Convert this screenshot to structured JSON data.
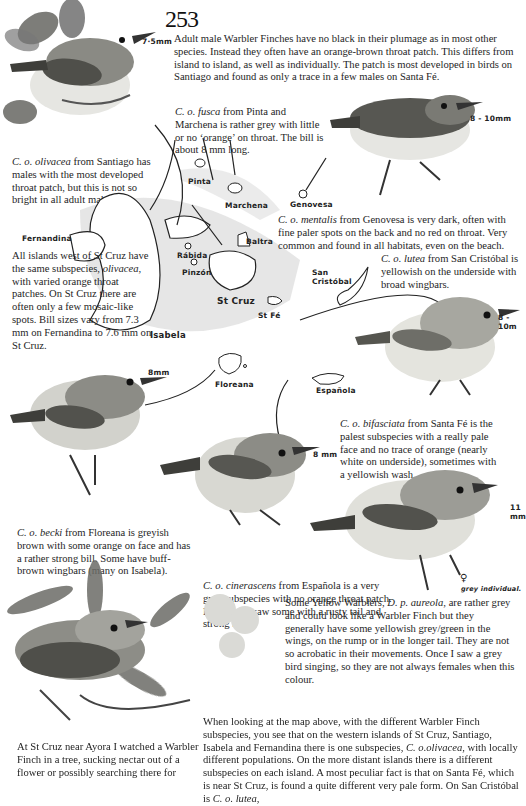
{
  "page": {
    "number": "253"
  },
  "intro": {
    "text": "Adult male Warbler Finches have no black in their plumage as in most other species. Instead they often have an orange-brown throat patch. This differs from island to island, as well as individually. The patch is most developed in birds on Santiago and found as only a trace in a few males on Santa Fé."
  },
  "captions": {
    "fusca": {
      "taxon": "C. o. fusca",
      "text": " from Pinta and Marchena is rather grey with little or no ‘orange’ on throat. The bill is about 8 mm long."
    },
    "olivacea": {
      "taxon": "C. o. olivacea",
      "text": " from Santiago has males with the most developed throat patch, but this is not so bright in all adult males."
    },
    "mentalis": {
      "taxon": "C. o. mentalis",
      "text": " from Genovesa is very dark, often with fine paler spots on the back and no red on throat. Very common and found in all habitats, even on the beach."
    },
    "lutea": {
      "taxon": "C. o. lutea",
      "text": " from San Cristóbal is yellowish on the underside with broad wingbars."
    },
    "west_islands": {
      "text_a": "All islands west of St Cruz have the same subspecies, ",
      "taxon": "olivacea",
      "text_b": ", with varied orange throat patches. On St Cruz there are often only a few mosaic-like spots. Bill sizes vary from 7.3 mm on Fernandina to 7.6 mm on St Cruz."
    },
    "bifasciata": {
      "taxon": "C. o. bifasciata",
      "text": " from Santa Fé is the palest subspecies with a really pale face and no trace of orange (nearly white on underside), sometimes with a yellowish wash."
    },
    "becki": {
      "taxon": "C. o. becki",
      "text": " from Floreana is greyish brown with some orange on face and has a rather strong bill. Some have buff-brown wingbars (many on Isabela)."
    },
    "cinerascens": {
      "taxon": "C. o. cinerascens",
      "text": " from Española is a very grey subspecies with no orange throat patch. However, I saw some with a rusty tail and strong bill."
    },
    "yellow_warbler": {
      "text_a": "Some Yellow Warblers, ",
      "taxon": "D. p. aureola",
      "text_b": ", are rather grey and could look like a Warbler Finch but they generally have some yellowish grey/green in the wings, on the rump or in the longer tail. They are not so acrobatic in their movements. Once I saw a grey bird singing, so they are not always females when this colour."
    },
    "ayora": {
      "text": "At St Cruz near Ayora I watched a Warbler Finch in a tree, sucking nectar out of a flower or possibly searching there for"
    },
    "map_summary": {
      "text_a": "When looking at the map above, with the different Warbler Finch subspecies, you see that on the western islands of St Cruz, Santiago, Isabela and Fernandina there is one subspecies, ",
      "taxon": "C. o.olivacea",
      "text_b": ", with locally different populations. On the more distant islands there is a different subspecies on each island. A most peculiar fact is that on Santa Fé, which is near St Cruz, is found a quite different very pale form. On San Cristóbal is ",
      "taxon2": "C. o. lutea",
      "text_c": ","
    }
  },
  "map_labels": {
    "pinta": "Pinta",
    "marchena": "Marchena",
    "genovesa": "Genovesa",
    "fernandina": "Fernandina",
    "baltra": "Baltra",
    "rabida": "Rábida",
    "pinzon": "Pinzón",
    "st_cruz": "St Cruz",
    "st_fe": "St Fé",
    "san_cristobal_1": "San",
    "san_cristobal_2": "Cristóbal",
    "isabela": "Isabela",
    "floreana": "Floreana",
    "espanola": "Española"
  },
  "measurements": {
    "bird1": "7·5mm",
    "bird2": "8 - 10mm",
    "bird3": "8 - 10m",
    "bird4": "8mm",
    "bird5": "8 mm",
    "bird6": "11 mm",
    "female_note_symbol": "♀",
    "female_note": "grey individual."
  },
  "colors": {
    "ink": "#1e1e1e",
    "bird_dark": "#5a5a55",
    "bird_mid": "#8d8d87",
    "bird_light": "#d8d8d2",
    "map_wash": "#d9d9d9"
  }
}
